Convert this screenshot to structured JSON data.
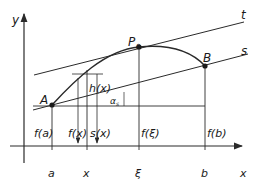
{
  "figure": {
    "axes": {
      "y_label": "y",
      "x_label": "x"
    },
    "points": {
      "A": "A",
      "P0": "P",
      "P0_sub": "0",
      "B": "B"
    },
    "lines": {
      "tangent": "t",
      "secant": "s"
    },
    "segment_labels": {
      "h": "h(x)",
      "alpha": "α",
      "alpha_sub": "s",
      "fa": "f(a)",
      "fx": "f(x)",
      "sx": "s(x)",
      "fxi": "f(ξ)",
      "fb": "f(b)"
    },
    "x_ticks": [
      "a",
      "x",
      "ξ",
      "b"
    ],
    "colors": {
      "ink": "#2a2a2a",
      "background": "#ffffff"
    }
  }
}
